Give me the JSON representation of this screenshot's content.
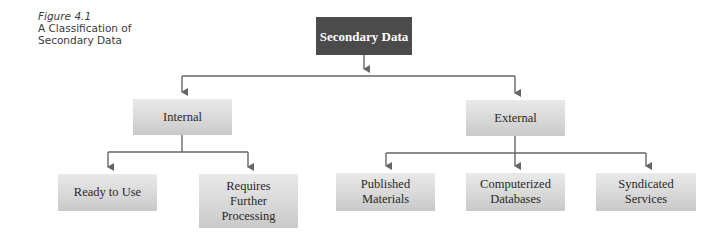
{
  "caption": {
    "figure_label": "Figure 4.1",
    "title_line1": "A Classification of",
    "title_line2": "Secondary Data"
  },
  "diagram": {
    "type": "tree",
    "root": {
      "label": "Secondary Data"
    },
    "level1": [
      {
        "label": "Internal"
      },
      {
        "label": "External"
      }
    ],
    "level2": {
      "internal": [
        {
          "label": "Ready to Use"
        },
        {
          "label": "Requires\nFurther\nProcessing"
        }
      ],
      "external": [
        {
          "label": "Published\nMaterials"
        },
        {
          "label": "Computerized\nDatabases"
        },
        {
          "label": "Syndicated\nServices"
        }
      ]
    },
    "colors": {
      "root_fill": "#4b4b4b",
      "node_fill": "#d8d8d8",
      "connector": "#666666"
    }
  }
}
